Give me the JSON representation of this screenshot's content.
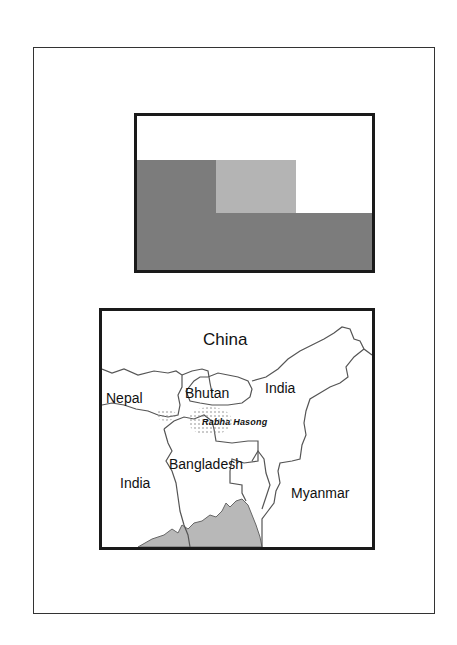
{
  "figure": {
    "legend_box": {
      "blocks": [
        {
          "name": "dark-gray-region",
          "color": "#7c7c7c"
        },
        {
          "name": "light-gray-region",
          "color": "#b4b4b4"
        },
        {
          "name": "dark-gray-band",
          "color": "#7c7c7c"
        }
      ]
    },
    "map": {
      "labels": {
        "china": "China",
        "nepal": "Nepal",
        "bhutan": "Bhutan",
        "india_ne": "India",
        "rabha_hasong": "Rabha Hasong",
        "bangladesh": "Bangladesh",
        "india_w": "India",
        "myanmar": "Myanmar"
      },
      "colors": {
        "border_line": "#555555",
        "sea_fill": "#b8b8b8",
        "stipple": "#888888"
      }
    }
  }
}
